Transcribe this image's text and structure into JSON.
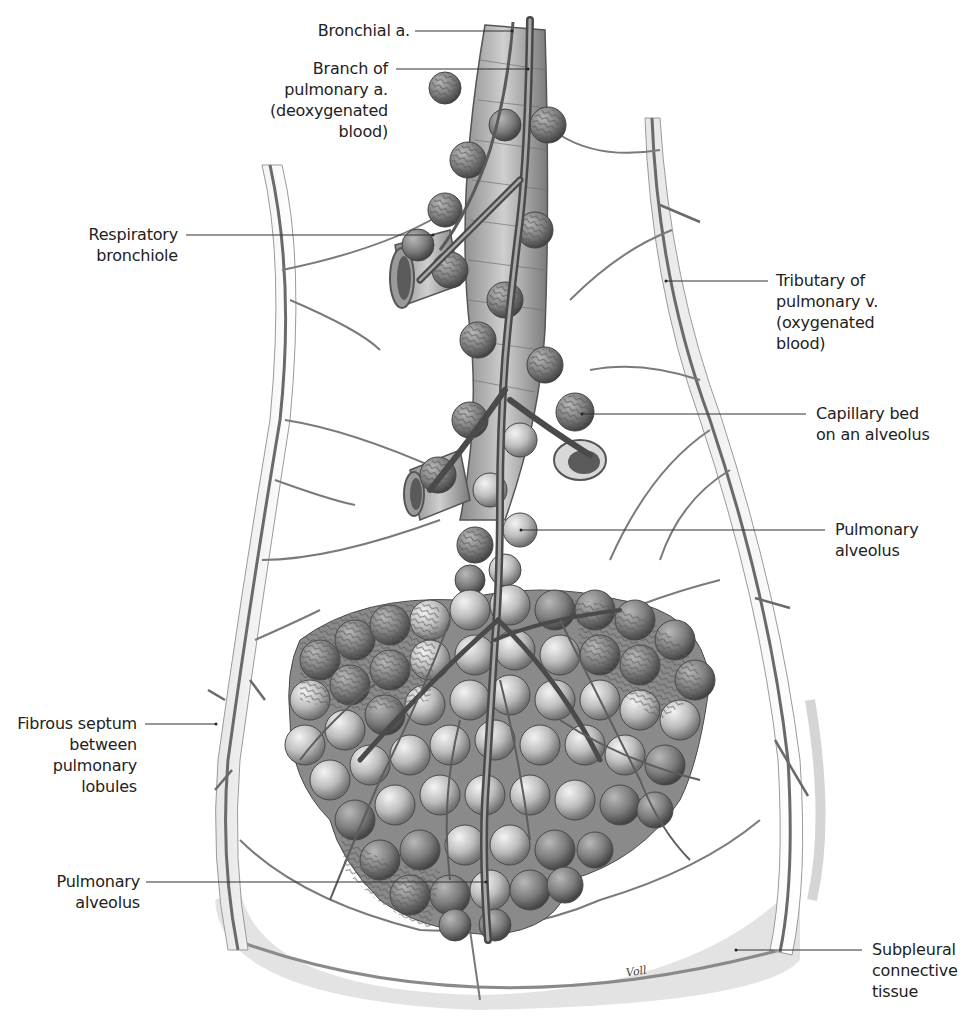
{
  "figure": {
    "signature": "Voll",
    "colors": {
      "background": "#ffffff",
      "vessel": "#6e6e6e",
      "vessel_dark": "#4a4a4a",
      "alveolus_light": "#d9d9d9",
      "alveolus_dark": "#7a7a7a",
      "septum": "#c8c8c8",
      "label_text": "#222222",
      "leader_line": "#333333"
    }
  },
  "labels": [
    {
      "id": "bronchial-artery",
      "text": "Bronchial a.",
      "align": "right",
      "box": [
        250,
        20,
        160
      ],
      "line": [
        [
          415,
          31
        ],
        [
          512,
          31
        ]
      ]
    },
    {
      "id": "branch-pulmonary-artery",
      "text": "Branch of\npulmonary a.\n(deoxygenated\nblood)",
      "align": "right",
      "box": [
        230,
        62,
        158
      ],
      "line": [
        [
          396,
          69
        ],
        [
          528,
          69
        ]
      ]
    },
    {
      "id": "respiratory-bronchiole",
      "text": "Respiratory\nbronchiole",
      "align": "right",
      "box": [
        40,
        224,
        138
      ],
      "line": [
        [
          186,
          235
        ],
        [
          433,
          235
        ]
      ]
    },
    {
      "id": "tributary-pulmonary-vein",
      "text": "Tributary of\npulmonary v.\n(oxygenated\nblood)",
      "align": "left",
      "box": [
        776,
        270,
        180
      ],
      "line": [
        [
          666,
          281
        ],
        [
          768,
          281
        ]
      ]
    },
    {
      "id": "capillary-bed",
      "text": "Capillary bed\non an alveolus",
      "align": "left",
      "box": [
        816,
        403,
        150
      ],
      "line": [
        [
          582,
          414
        ],
        [
          806,
          414
        ]
      ]
    },
    {
      "id": "pulmonary-alveolus-upper",
      "text": "Pulmonary\nalveolus",
      "align": "left",
      "box": [
        835,
        519,
        120
      ],
      "line": [
        [
          521,
          530
        ],
        [
          825,
          530
        ]
      ]
    },
    {
      "id": "fibrous-septum",
      "text": "Fibrous septum\nbetween\npulmonary\nlobules",
      "align": "right",
      "box": [
        0,
        714,
        137
      ],
      "line": [
        [
          145,
          724
        ],
        [
          216,
          724
        ]
      ]
    },
    {
      "id": "pulmonary-alveolus-lower",
      "text": "Pulmonary\nalveolus",
      "align": "right",
      "box": [
        20,
        870,
        120
      ],
      "line": [
        [
          146,
          882
        ],
        [
          486,
          882
        ]
      ]
    },
    {
      "id": "subpleural-connective-tissue",
      "text": "Subpleural\nconnective\ntissue",
      "align": "left",
      "box": [
        872,
        938,
        100
      ],
      "line": [
        [
          736,
          950
        ],
        [
          862,
          950
        ]
      ]
    }
  ]
}
